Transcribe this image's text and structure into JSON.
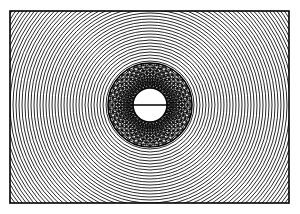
{
  "figure": {
    "background_color": "#ffffff",
    "stroke_color": "#000000",
    "canvas": {
      "width": 300,
      "height": 214
    }
  },
  "frame": {
    "name": "rectangular-border",
    "x": 10,
    "y": 11,
    "width": 279,
    "height": 192,
    "stroke_width": 1.6,
    "stroke_color": "#000000",
    "fill_color": "#ffffff"
  },
  "center": {
    "cx": 150,
    "cy": 105
  },
  "outer_rings": {
    "name": "concentric-ring-field",
    "count": 64,
    "start_radius": 44,
    "spacing": 3.0,
    "stroke_width": 0.85,
    "stroke_color": "#000000"
  },
  "annulus": {
    "name": "textured-annulus",
    "outer_radius": 42,
    "inner_radius": 17,
    "boundary_stroke_width": 1.6,
    "mesh": {
      "radial_spokes": 60,
      "mesh_circles": 9,
      "mesh_circle_spacing": 2.9,
      "bubble_rows": 9,
      "bubbles_per_row": 34,
      "bubble_radius": 3.1,
      "stroke_width": 0.7
    }
  },
  "inner_disc": {
    "name": "center-white-disc",
    "radius": 17,
    "fill_color": "#ffffff",
    "stroke_width": 1.5
  },
  "diameter_line": {
    "name": "horizontal-diameter-line",
    "x1": 133,
    "x2": 167,
    "y": 105,
    "stroke_width": 1.5
  }
}
